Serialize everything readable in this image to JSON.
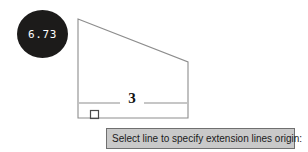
{
  "canvas": {
    "width": 308,
    "height": 152,
    "background_color": "#ffffff",
    "description": "CAD drafting canvas with a quadrilateral profile being dimensioned"
  },
  "value_bubble": {
    "value": "6.73",
    "fill_color": "#1c1b1a",
    "text_color": "#ffffff",
    "shape": "ellipse"
  },
  "geometry": {
    "name": "profile-outline",
    "stroke_color": "#8d8d8d",
    "vertices": [
      {
        "label": "top-left-apex",
        "x": 78,
        "y": 19
      },
      {
        "label": "right-upper",
        "x": 188,
        "y": 62
      },
      {
        "label": "bottom-right",
        "x": 188,
        "y": 118
      },
      {
        "label": "bottom-left",
        "x": 78,
        "y": 118
      }
    ]
  },
  "dimension": {
    "label": "3",
    "label_color": "#111111",
    "line_color": "#8d8d8d",
    "line_y": 103,
    "line_x_start": 78,
    "line_x_end": 188,
    "text_gap_start": 120,
    "text_gap_end": 144
  },
  "osnap_marker": {
    "name": "square-osnap-marker",
    "type": "perpendicular",
    "x": 94,
    "y": 114,
    "size": 8,
    "stroke_color": "#4a4a4a"
  },
  "prompt": {
    "text": "Select line to specify extension lines origin:",
    "background_color": "#c9c9c9",
    "border_color": "#6f6f6f",
    "text_color": "#1a1a1a"
  }
}
